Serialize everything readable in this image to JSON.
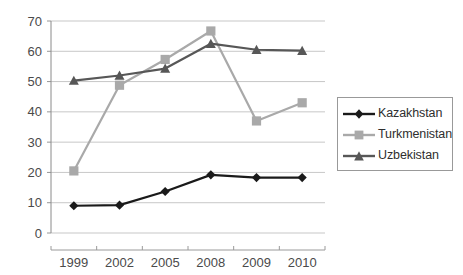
{
  "chart_data": {
    "type": "line",
    "title": "",
    "xlabel": "",
    "ylabel": "",
    "categories": [
      "1999",
      "2002",
      "2005",
      "2008",
      "2009",
      "2010"
    ],
    "ylim": [
      0,
      70
    ],
    "ytick_step": 10,
    "yticks": [
      "0",
      "10",
      "20",
      "30",
      "40",
      "50",
      "60",
      "70"
    ],
    "grid": "horizontal",
    "legend_position": "right",
    "series": [
      {
        "name": "Kazakhstan",
        "color": "#1a1a1a",
        "marker": "diamond",
        "values": [
          9.0,
          9.2,
          13.7,
          19.2,
          18.3,
          18.3
        ]
      },
      {
        "name": "Turkmenistan",
        "color": "#a9a9a9",
        "marker": "square",
        "values": [
          20.5,
          48.8,
          57.3,
          66.7,
          37.0,
          43.0
        ]
      },
      {
        "name": "Uzbekistan",
        "color": "#575757",
        "marker": "triangle",
        "values": [
          50.3,
          52.0,
          54.3,
          62.5,
          60.5,
          60.2
        ]
      }
    ]
  },
  "legend": {
    "items": [
      {
        "label": "Kazakhstan"
      },
      {
        "label": "Turkmenistan"
      },
      {
        "label": "Uzbekistan"
      }
    ]
  },
  "axes": {
    "x_tick_labels": [
      "1999",
      "2002",
      "2005",
      "2008",
      "2009",
      "2010"
    ],
    "y_tick_labels": [
      "70",
      "60",
      "50",
      "40",
      "30",
      "20",
      "10",
      "0"
    ]
  }
}
